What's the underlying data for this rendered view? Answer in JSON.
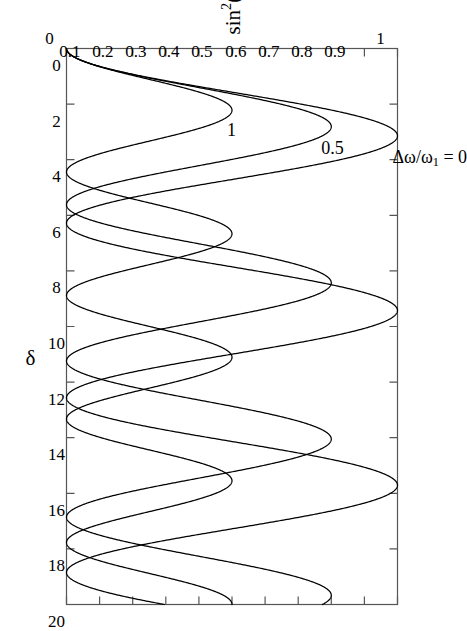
{
  "figure": {
    "rotation_degrees": 90,
    "background_color": "#ffffff",
    "line_color": "#000000",
    "frame_color": "#555555"
  },
  "axes": {
    "x": {
      "title": "δ",
      "ticks": [
        "0",
        "2",
        "4",
        "6",
        "8",
        "10",
        "12",
        "14",
        "16",
        "18",
        "20"
      ],
      "min": 0,
      "max": 20
    },
    "y": {
      "title_prefix": "sin",
      "title_exponent": "2",
      "title_suffix": "(θ/2)",
      "title_plain": "sin²(θ/2)",
      "ticks": [
        "0",
        "0.1",
        "0.2",
        "0.3",
        "0.4",
        "0.5",
        "0.6",
        "0.7",
        "0.8",
        "0.9",
        "1"
      ],
      "min": 0,
      "max": 1
    }
  },
  "annotations": {
    "parameter_label_prefix": "Δω/ω",
    "parameter_label_sub": "1",
    "parameter_label_suffix": " = 0",
    "parameter_label_plain": "Δω/ω₁ = 0",
    "curve_label_middle": "0.5",
    "curve_label_inner": "1"
  },
  "chart_data": {
    "type": "line",
    "title": "",
    "xlabel": "δ",
    "ylabel": "sin²(θ/2)",
    "xlim": [
      0,
      20
    ],
    "ylim": [
      0,
      1
    ],
    "grid": false,
    "legend": "inline-curve-labels",
    "xticks": [
      0,
      2,
      4,
      6,
      8,
      10,
      12,
      14,
      16,
      18,
      20
    ],
    "yticks": [
      0,
      0.1,
      0.2,
      0.3,
      0.4,
      0.5,
      0.6,
      0.7,
      0.8,
      0.9,
      1.0
    ],
    "formula": "sin^2(theta/2) = 1/(1+r^2) * sin^2( delta*sqrt(1+r^2)/2 ), r = dw/w1",
    "series": [
      {
        "name": "Δω/ω₁ = 0",
        "ratio": 0,
        "amplitude": 1.0,
        "period_in_delta": 6.283,
        "peak_positions": [
          3.14,
          9.42,
          15.71
        ],
        "zero_positions": [
          0,
          6.28,
          12.57,
          18.85
        ],
        "peak_value": 1.0
      },
      {
        "name": "Δω/ω₁ = 0.5",
        "ratio": 0.5,
        "amplitude": 0.8,
        "period_in_delta": 5.619,
        "peak_positions": [
          2.81,
          8.43,
          14.05,
          19.67
        ],
        "zero_positions": [
          0,
          5.62,
          11.24,
          16.86
        ],
        "peak_value": 0.8
      },
      {
        "name": "Δω/ω₁ = 1",
        "ratio": 1.0,
        "amplitude": 0.5,
        "period_in_delta": 4.443,
        "peak_positions": [
          2.22,
          6.66,
          11.11,
          15.55,
          19.99
        ],
        "zero_positions": [
          0,
          4.44,
          8.89,
          13.33,
          17.77
        ],
        "peak_value": 0.5
      }
    ]
  }
}
